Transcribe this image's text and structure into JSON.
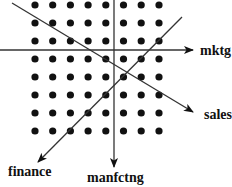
{
  "diagram": {
    "colors": {
      "ink": "#111111",
      "line": "#333333",
      "background": "#ffffff"
    },
    "grid": {
      "columns": 8,
      "rows": 8,
      "x": [
        35,
        52.7,
        70.4,
        88.1,
        105.8,
        123.5,
        141.2,
        159
      ],
      "y": [
        5,
        23,
        41,
        59,
        77,
        95,
        113,
        131
      ],
      "dot_radius": 3.6
    },
    "axes": [
      {
        "id": "mktg",
        "label": "mktg",
        "from": [
          0,
          50
        ],
        "to": [
          193,
          50
        ],
        "label_pos": [
          200,
          55
        ]
      },
      {
        "id": "sales",
        "label": "sales",
        "from": [
          12,
          3
        ],
        "to": [
          193,
          112
        ],
        "label_pos": [
          204,
          119
        ]
      },
      {
        "id": "finance",
        "label": "finance",
        "from": [
          182,
          17
        ],
        "to": [
          38,
          162
        ],
        "label_pos": [
          8,
          176
        ]
      },
      {
        "id": "manfctng",
        "label": "manfctng",
        "from": [
          114,
          0
        ],
        "to": [
          114,
          167
        ],
        "label_pos": [
          87,
          182
        ]
      }
    ]
  }
}
